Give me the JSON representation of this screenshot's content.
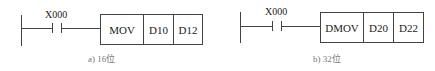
{
  "diagrams": [
    {
      "contact": "X000",
      "instruction": "MOV",
      "operands": [
        "D10",
        "D12"
      ],
      "caption": "a) 16位"
    },
    {
      "contact": "X000",
      "instruction": "DMOV",
      "operands": [
        "D20",
        "D22"
      ],
      "caption": "b) 32位"
    }
  ]
}
